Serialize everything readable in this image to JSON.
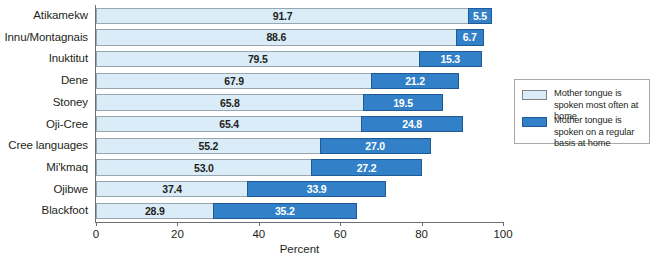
{
  "chart_data": {
    "type": "bar",
    "orientation": "horizontal",
    "stacked": true,
    "title": "",
    "xlabel": "Percent",
    "ylabel": "",
    "xlim": [
      0,
      100
    ],
    "xticks": [
      "0",
      "20",
      "40",
      "60",
      "80",
      "100"
    ],
    "grid": false,
    "legend_position": "right",
    "categories": [
      "Atikamekw",
      "Innu/Montagnais",
      "Inuktitut",
      "Dene",
      "Stoney",
      "Oji-Cree",
      "Cree languages",
      "Mi'kmaq",
      "Ojibwe",
      "Blackfoot"
    ],
    "series": [
      {
        "name": "Mother tongue is spoken most often at home",
        "color": "#d9ecf8",
        "values": [
          91.7,
          88.6,
          79.5,
          67.9,
          65.8,
          65.4,
          55.2,
          53.0,
          37.4,
          28.9
        ]
      },
      {
        "name": "Mother tongue is spoken on a regular basis at home",
        "color": "#3280c8",
        "values": [
          5.5,
          6.7,
          15.3,
          21.2,
          19.5,
          24.8,
          27.0,
          27.2,
          33.9,
          35.2
        ]
      }
    ],
    "value_labels": [
      {
        "light": "91.7",
        "dark": "5.5"
      },
      {
        "light": "88.6",
        "dark": "6.7"
      },
      {
        "light": "79.5",
        "dark": "15.3"
      },
      {
        "light": "67.9",
        "dark": "21.2"
      },
      {
        "light": "65.8",
        "dark": "19.5"
      },
      {
        "light": "65.4",
        "dark": "24.8"
      },
      {
        "light": "55.2",
        "dark": "27.0"
      },
      {
        "light": "53.0",
        "dark": "27.2"
      },
      {
        "light": "37.4",
        "dark": "33.9"
      },
      {
        "light": "28.9",
        "dark": "35.2"
      }
    ]
  },
  "legend": {
    "items": [
      {
        "label": "Mother tongue is spoken most often at home",
        "color": "#d9ecf8"
      },
      {
        "label": "Mother tongue is spoken on a regular basis at home",
        "color": "#3280c8"
      }
    ]
  }
}
